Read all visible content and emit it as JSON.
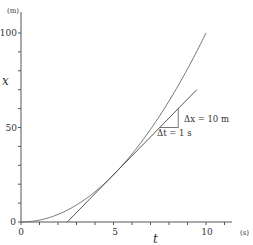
{
  "chart_data": {
    "type": "line",
    "title": "",
    "xlabel": "t",
    "xunit": "(s)",
    "ylabel": "x",
    "yunit": "(m)",
    "xlim": [
      0,
      11
    ],
    "ylim": [
      0,
      110
    ],
    "x_ticks_minor_step": 1,
    "y_ticks_minor_step": 10,
    "x_tick_labels": [
      "0",
      "5",
      "10"
    ],
    "y_tick_labels": [
      "0",
      "50",
      "100"
    ],
    "grid": false,
    "legend": null,
    "series": [
      {
        "name": "position curve x = t^2",
        "x": [
          0,
          1,
          2,
          3,
          4,
          5,
          6,
          7,
          8,
          9,
          10
        ],
        "y": [
          0,
          1,
          4,
          9,
          16,
          25,
          36,
          49,
          64,
          81,
          100
        ]
      },
      {
        "name": "tangent at t = 5 s (slope 10 m/s)",
        "x": [
          2.5,
          9.5
        ],
        "y": [
          0,
          70
        ]
      }
    ],
    "annotations": [
      {
        "text": "Δx = 10 m",
        "at": [
          8.6,
          55
        ]
      },
      {
        "text": "Δt = 1 s",
        "at": [
          7.2,
          46
        ]
      }
    ],
    "slope_triangle": {
      "t0": 7.5,
      "t1": 8.5,
      "x0": 50,
      "x1": 60
    }
  },
  "labels": {
    "y_unit": "(m)",
    "x_unit": "(s)",
    "y_axis": "x",
    "x_axis": "t",
    "dx": "Δx = 10 m",
    "dt": "Δt = 1 s",
    "y0": "0",
    "y50": "50",
    "y100": "100",
    "x0": "0",
    "x5": "5",
    "x10": "10"
  }
}
